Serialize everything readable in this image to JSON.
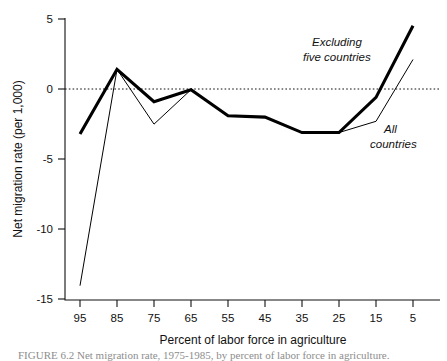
{
  "chart_data": {
    "type": "line",
    "title": "",
    "xlabel": "Percent of labor force in agriculture",
    "ylabel": "Net migration rate (per 1,000)",
    "x": [
      95,
      85,
      75,
      65,
      55,
      45,
      35,
      25,
      15,
      5
    ],
    "xticklabels": [
      "95",
      "85",
      "75",
      "65",
      "55",
      "45",
      "35",
      "25",
      "15",
      "5"
    ],
    "yticklabels": [
      "5",
      "0",
      "-5",
      "-10",
      "-15"
    ],
    "yticks": [
      5,
      0,
      -5,
      -10,
      -15
    ],
    "xlim": [
      100,
      0
    ],
    "ylim": [
      -15,
      5
    ],
    "x_axis_inverted": true,
    "grid": false,
    "zero_reference_line": 0,
    "legend_position": "inline-annotations",
    "series": [
      {
        "name": "Excluding five countries",
        "style": "thick",
        "values": [
          -3.2,
          1.4,
          -0.9,
          -0.05,
          -1.9,
          -2.0,
          -3.1,
          -3.1,
          -0.6,
          4.5
        ]
      },
      {
        "name": "All countries",
        "style": "thin",
        "values": [
          -14.0,
          1.4,
          -2.5,
          -0.05,
          -1.9,
          -2.0,
          -3.1,
          -3.1,
          -2.3,
          2.1
        ]
      }
    ],
    "annotations": [
      {
        "text_line1": "Excluding",
        "text_line2": "five countries"
      },
      {
        "text_line1": "All",
        "text_line2": "countries"
      }
    ]
  },
  "figure": {
    "caption": "FIGURE 6.2  Net migration rate, 1975-1985, by percent of labor force in agriculture."
  }
}
